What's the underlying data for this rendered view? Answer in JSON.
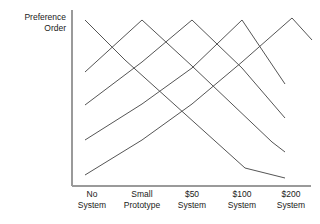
{
  "figure": {
    "ylabel": "Preference\nOrder",
    "line_color": "#555555",
    "axis_color": "#9a9a9a",
    "text_color": "#1a1a1a",
    "background": "#ffffff"
  },
  "axes": {
    "y_axis_x": 72,
    "y_axis_top": 10,
    "x_axis_y": 186,
    "x_axis_left": 72,
    "x_axis_right": 311
  },
  "chart_data": {
    "type": "line",
    "title": "",
    "xlabel": "",
    "ylabel": "Preference Order",
    "grid": false,
    "legend": null,
    "categories": [
      "No System",
      "Small Prototype",
      "$50 System",
      "$100 System",
      "$200 System"
    ],
    "category_labels": [
      {
        "line1": "No",
        "line2": "System",
        "x": 92
      },
      {
        "line1": "Small",
        "line2": "Prototype",
        "x": 142
      },
      {
        "line1": "$50",
        "line2": "System",
        "x": 192
      },
      {
        "line1": "$100",
        "line2": "System",
        "x": 242
      },
      {
        "line1": "$200",
        "line2": "System",
        "x": 291
      }
    ],
    "series": [
      {
        "name": "peak-no-system",
        "peak_category": "No System",
        "points": [
          [
            85,
            20
          ],
          [
            125,
            60
          ],
          [
            165,
            96
          ],
          [
            205,
            132
          ],
          [
            245,
            168
          ],
          [
            285,
            178
          ]
        ]
      },
      {
        "name": "peak-small-prototype",
        "peak_category": "Small Prototype",
        "points": [
          [
            85,
            72
          ],
          [
            142,
            20
          ],
          [
            192,
            66
          ],
          [
            232,
            104
          ],
          [
            272,
            142
          ],
          [
            285,
            152
          ]
        ]
      },
      {
        "name": "peak-50-system",
        "peak_category": "$50 System",
        "points": [
          [
            85,
            105
          ],
          [
            142,
            62
          ],
          [
            192,
            20
          ],
          [
            242,
            68
          ],
          [
            285,
            118
          ]
        ]
      },
      {
        "name": "peak-100-system",
        "peak_category": "$100 System",
        "points": [
          [
            85,
            140
          ],
          [
            142,
            104
          ],
          [
            192,
            68
          ],
          [
            242,
            20
          ],
          [
            285,
            84
          ]
        ]
      },
      {
        "name": "peak-200-system",
        "peak_category": "$200 System",
        "points": [
          [
            85,
            175
          ],
          [
            142,
            140
          ],
          [
            192,
            104
          ],
          [
            242,
            62
          ],
          [
            292,
            18
          ],
          [
            312,
            40
          ]
        ]
      }
    ]
  }
}
